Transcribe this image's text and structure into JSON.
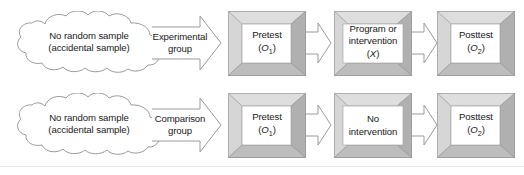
{
  "figure": {
    "type": "flow-diagram",
    "background_color": "#ffffff",
    "outline_color": "#9a9a9a",
    "bevel_light_color": "#d9d9d9",
    "bevel_dark_color": "#b3b3b3",
    "panel_color": "#ffffff",
    "text_color": "#1a1a1a",
    "rule_color": "#e4e6e8"
  },
  "rows": [
    {
      "id": "experimental-row",
      "source": {
        "shape": "cloud",
        "line1": "No random sample",
        "line2": "(accidental sample)"
      },
      "assignment_arrow": {
        "line1": "Experimental",
        "line2": "group"
      },
      "stages": [
        {
          "id": "pretest",
          "line1": "Pretest",
          "symbol_open": "(",
          "symbol": "O",
          "symbol_sub": "1",
          "symbol_close": ")"
        },
        {
          "id": "treatment",
          "line1": "Program or",
          "line2": "intervention",
          "symbol_open": "(",
          "symbol": "X",
          "symbol_sub": "",
          "symbol_close": ")"
        },
        {
          "id": "posttest",
          "line1": "Posttest",
          "symbol_open": "(",
          "symbol": "O",
          "symbol_sub": "2",
          "symbol_close": ")"
        }
      ]
    },
    {
      "id": "comparison-row",
      "source": {
        "shape": "cloud",
        "line1": "No random sample",
        "line2": "(accidental sample)"
      },
      "assignment_arrow": {
        "line1": "Comparison",
        "line2": "group"
      },
      "stages": [
        {
          "id": "pretest",
          "line1": "Pretest",
          "symbol_open": "(",
          "symbol": "O",
          "symbol_sub": "1",
          "symbol_close": ")"
        },
        {
          "id": "no-treatment",
          "line1": "No",
          "line2": "intervention",
          "symbol_open": "",
          "symbol": "",
          "symbol_sub": "",
          "symbol_close": ""
        },
        {
          "id": "posttest",
          "line1": "Posttest",
          "symbol_open": "(",
          "symbol": "O",
          "symbol_sub": "2",
          "symbol_close": ")"
        }
      ]
    }
  ]
}
